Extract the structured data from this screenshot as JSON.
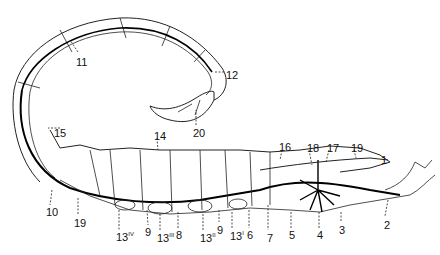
{
  "diagram": {
    "labels": [
      {
        "id": "l1",
        "text": "1",
        "x": 381,
        "y": 155
      },
      {
        "id": "l2",
        "text": "2",
        "x": 384,
        "y": 220
      },
      {
        "id": "l3",
        "text": "3",
        "x": 339,
        "y": 225
      },
      {
        "id": "l4",
        "text": "4",
        "x": 317,
        "y": 230
      },
      {
        "id": "l5",
        "text": "5",
        "x": 289,
        "y": 230
      },
      {
        "id": "l6",
        "text": "6",
        "x": 247,
        "y": 230
      },
      {
        "id": "l7",
        "text": "7",
        "x": 267,
        "y": 233
      },
      {
        "id": "l8",
        "text": "8",
        "x": 176,
        "y": 230
      },
      {
        "id": "l9a",
        "text": "9",
        "x": 145,
        "y": 227
      },
      {
        "id": "l9b",
        "text": "9",
        "x": 217,
        "y": 225
      },
      {
        "id": "l10",
        "text": "10",
        "x": 46,
        "y": 207
      },
      {
        "id": "l11",
        "text": "11",
        "x": 76,
        "y": 57
      },
      {
        "id": "l12",
        "text": "12",
        "x": 226,
        "y": 70
      },
      {
        "id": "l13i",
        "text": "13",
        "sup": "I",
        "x": 230,
        "y": 230
      },
      {
        "id": "l13ii",
        "text": "13",
        "sup": "II",
        "x": 200,
        "y": 232
      },
      {
        "id": "l13iii",
        "text": "13",
        "sup": "III",
        "x": 157,
        "y": 232
      },
      {
        "id": "l13iv",
        "text": "13",
        "sup": "IV",
        "x": 116,
        "y": 231
      },
      {
        "id": "l14",
        "text": "14",
        "x": 154,
        "y": 131
      },
      {
        "id": "l15",
        "text": "15",
        "x": 54,
        "y": 128
      },
      {
        "id": "l16",
        "text": "16",
        "x": 279,
        "y": 142
      },
      {
        "id": "l17",
        "text": "17",
        "x": 327,
        "y": 143
      },
      {
        "id": "l18",
        "text": "18",
        "x": 307,
        "y": 143
      },
      {
        "id": "l19a",
        "text": "19",
        "x": 74,
        "y": 218
      },
      {
        "id": "l19b",
        "text": "19",
        "x": 351,
        "y": 143
      },
      {
        "id": "l20",
        "text": "20",
        "x": 193,
        "y": 128
      }
    ]
  }
}
